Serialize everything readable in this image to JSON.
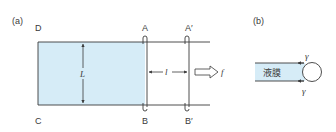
{
  "figure": {
    "panel_a": {
      "tag": "(a)",
      "corner_labels": {
        "D": "D",
        "C": "C"
      },
      "bar_AB": {
        "top": "A",
        "bottom": "B"
      },
      "bar_A2B2": {
        "top": "A′",
        "bottom": "B′"
      },
      "width_label": "L",
      "displacement_label": "l",
      "force_label": "f",
      "film_color": "#d6ecf7",
      "line_color": "#3a3a3a"
    },
    "panel_b": {
      "tag": "(b)",
      "film_label": "液膜",
      "tension_top": "γ",
      "tension_bottom": "γ",
      "film_color": "#d6ecf7"
    }
  }
}
